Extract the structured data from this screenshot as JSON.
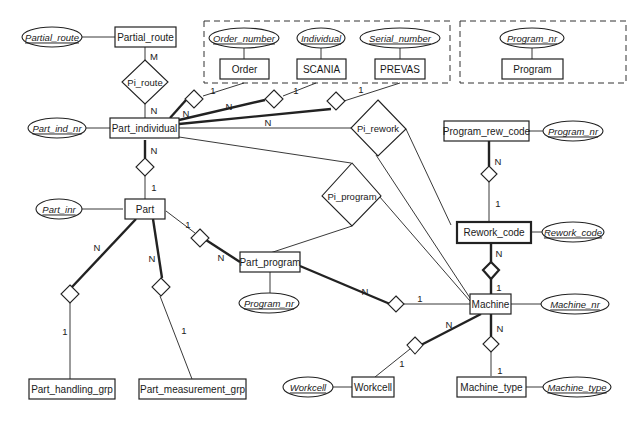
{
  "entities": {
    "partial_route": "Partial_route",
    "part_individual": "Part_individual",
    "order": "Order",
    "scania": "SCANIA",
    "prevas": "PREVAS",
    "program": "Program",
    "program_rew_code": "Program_rew_code",
    "rework_code": "Rework_code",
    "part": "Part",
    "part_program": "Part_program",
    "machine": "Machine",
    "machine_type": "Machine_type",
    "workcell": "Workcell",
    "part_handling_grp": "Part_handling_grp",
    "part_measurement_grp": "Part_measurement_grp"
  },
  "attributes": {
    "partial_route": "Partial_route",
    "part_ind_nr": "Part_ind_nr",
    "order_number": "Order_number",
    "individual": "Individual",
    "serial_number": "Serial_number",
    "program_nr_group": "Program_nr",
    "program_nr_rew": "Program_nr",
    "rework_code": "Rework_code",
    "part_inr": "Part_inr",
    "program_nr_part": "Program_nr",
    "machine_nr": "Machine_nr",
    "machine_type": "Machine_type",
    "workcell": "Workcell"
  },
  "relationships": {
    "pi_route": "Pi_route",
    "pi_rework": "Pi_rework",
    "pi_program": "Pi_program"
  },
  "cardinalities": {
    "route_m": "M",
    "route_n": "N",
    "order_1": "1",
    "order_n": "N",
    "scania_1": "1",
    "scania_n": "N",
    "prevas_1": "1",
    "rework_n": "N",
    "pi_part_n": "N",
    "pi_part_1": "1",
    "part_pp_1": "1",
    "part_pp_n": "N",
    "part_hg_n": "N",
    "part_hg_1": "1",
    "part_mg_n": "N",
    "part_mg_1": "1",
    "prc_rc_n": "N",
    "prc_rc_1": "1",
    "rc_m_n": "N",
    "rc_m_1": "1",
    "pp_m_n": "N",
    "pp_m_1": "1",
    "m_wc_n": "N",
    "m_wc_1": "1",
    "m_mt_n": "N",
    "m_mt_1": "1"
  }
}
